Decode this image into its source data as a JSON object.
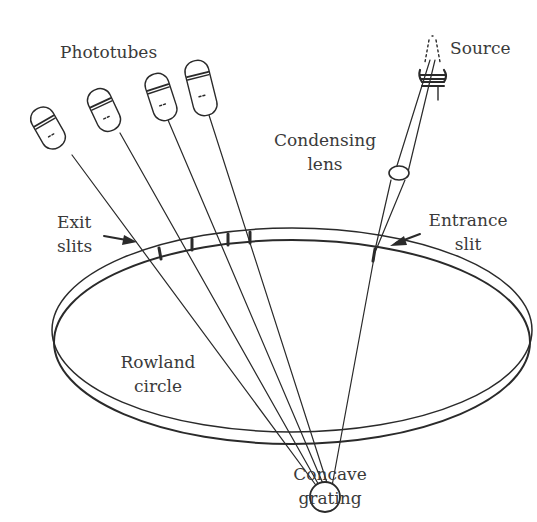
{
  "diagram": {
    "labels": {
      "phototubes": "Phototubes",
      "source": "Source",
      "condensing_lens_line1": "Condensing",
      "condensing_lens_line2": "lens",
      "exit_slits_line1": "Exit",
      "exit_slits_line2": "slits",
      "entrance_slit_line1": "Entrance",
      "entrance_slit_line2": "slit",
      "rowland_circle_line1": "Rowland",
      "rowland_circle_line2": "circle",
      "concave_grating_line1": "Concave",
      "concave_grating_line2": "grating"
    },
    "components": [
      {
        "name": "source",
        "type": "lamp-coil"
      },
      {
        "name": "condensing-lens",
        "type": "lens"
      },
      {
        "name": "entrance-slit",
        "type": "slit"
      },
      {
        "name": "concave-grating",
        "type": "grating"
      },
      {
        "name": "rowland-circle",
        "type": "ring"
      },
      {
        "name": "exit-slits",
        "type": "slit",
        "count": 4
      },
      {
        "name": "phototubes",
        "type": "detector",
        "count": 4
      }
    ],
    "colors": {
      "stroke": "#2a2a2a",
      "text": "#3a3a3a",
      "background": "#ffffff"
    }
  }
}
